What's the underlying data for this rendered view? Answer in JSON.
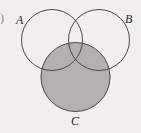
{
  "figure": {
    "type": "venn-diagram",
    "background_color": "#f1f0ee",
    "stroke_color": "#4a4745",
    "shade_color": "#b4b2ae",
    "label_color": "#2a2724"
  },
  "labels": {
    "a": "A",
    "b": "B",
    "c": "C",
    "edge_artifact": ")"
  },
  "sets": [
    {
      "id": "A",
      "label": "A",
      "label_position": "upper-left",
      "center_x": 52,
      "center_y": 40,
      "radius": 31,
      "filled": false,
      "fill": "none",
      "stroke": "#4a4745"
    },
    {
      "id": "B",
      "label": "B",
      "label_position": "upper-right",
      "center_x": 99,
      "center_y": 40,
      "radius": 31,
      "filled": false,
      "fill": "none",
      "stroke": "#4a4745"
    },
    {
      "id": "C",
      "label": "C",
      "label_position": "bottom-center",
      "center_x": 75.5,
      "center_y": 77,
      "radius": 35,
      "filled": true,
      "fill": "#b4b2ae",
      "stroke": "#4a4745"
    }
  ],
  "shaded_regions": [
    {
      "description": "Entire set C including its intersections with A and B",
      "expression": "C",
      "color": "#b4b2ae"
    }
  ]
}
